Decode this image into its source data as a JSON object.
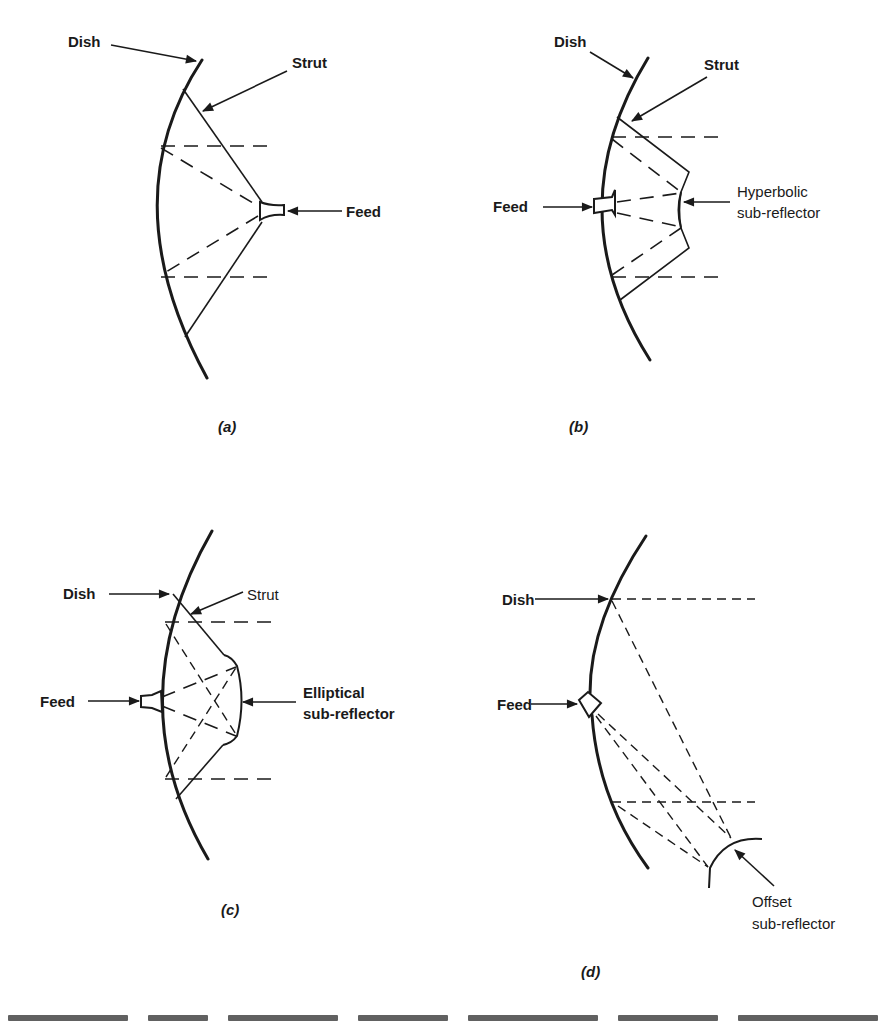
{
  "figure": {
    "panels": [
      {
        "id": "a",
        "sublabel": "(a)",
        "labels": {
          "dish": "Dish",
          "strut": "Strut",
          "feed": "Feed"
        }
      },
      {
        "id": "b",
        "sublabel": "(b)",
        "labels": {
          "dish": "Dish",
          "strut": "Strut",
          "feed": "Feed",
          "subreflector_line1": "Hyperbolic",
          "subreflector_line2": "sub-reflector"
        }
      },
      {
        "id": "c",
        "sublabel": "(c)",
        "labels": {
          "dish": "Dish",
          "strut": "Strut",
          "feed": "Feed",
          "subreflector_line1": "Elliptical",
          "subreflector_line2": "sub-reflector"
        }
      },
      {
        "id": "d",
        "sublabel": "(d)",
        "labels": {
          "dish": "Dish",
          "feed": "Feed",
          "subreflector_line1": "Offset",
          "subreflector_line2": "sub-reflector"
        }
      }
    ]
  },
  "colors": {
    "ink": "#1a1a1a",
    "background": "#ffffff"
  }
}
